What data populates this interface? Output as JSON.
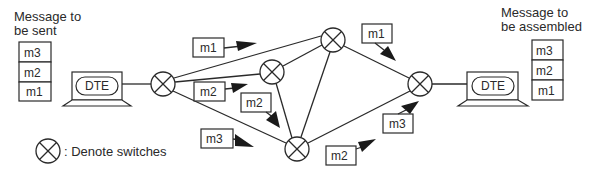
{
  "diagram": {
    "source": {
      "caption_line1": "Message to",
      "caption_line2": "be sent",
      "stack": [
        "m3",
        "m2",
        "m1"
      ],
      "terminal_label": "DTE"
    },
    "destination": {
      "caption_line1": "Message to",
      "caption_line2": "be assembled",
      "stack": [
        "m3",
        "m2",
        "m1"
      ],
      "terminal_label": "DTE"
    },
    "switches": [
      {
        "id": "S1",
        "cx": 163,
        "cy": 84
      },
      {
        "id": "S2",
        "cx": 272,
        "cy": 72
      },
      {
        "id": "S3",
        "cx": 333,
        "cy": 40
      },
      {
        "id": "S4",
        "cx": 297,
        "cy": 149
      },
      {
        "id": "S5",
        "cx": 420,
        "cy": 84
      }
    ],
    "links": [
      [
        "S1",
        "S3"
      ],
      [
        "S1",
        "S2"
      ],
      [
        "S1",
        "S4"
      ],
      [
        "S2",
        "S3"
      ],
      [
        "S2",
        "S4"
      ],
      [
        "S3",
        "S4"
      ],
      [
        "S3",
        "S5"
      ],
      [
        "S4",
        "S5"
      ]
    ],
    "packets": [
      {
        "label": "m1",
        "note": "on S1-S3 link"
      },
      {
        "label": "m2",
        "note": "on S1-S2 link"
      },
      {
        "label": "m2",
        "note": "on S2-S4 link"
      },
      {
        "label": "m3",
        "note": "on S1-S4 link"
      },
      {
        "label": "m1",
        "note": "on S3-S5 link"
      },
      {
        "label": "m2",
        "note": "on S4-S5 link"
      },
      {
        "label": "m3",
        "note": "into S5"
      }
    ],
    "legend": {
      "symbol": "switch-symbol",
      "text": ": Denote switches"
    }
  }
}
